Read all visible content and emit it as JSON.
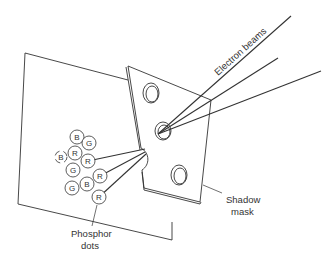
{
  "diagram": {
    "labels": {
      "electron_beams": "Electron beams",
      "shadow_mask_line1": "Shadow",
      "shadow_mask_line2": "mask",
      "phosphor_line1": "Phosphor",
      "phosphor_line2": "dots"
    },
    "phosphor_dots": [
      {
        "label": "B",
        "cx": 77,
        "cy": 137
      },
      {
        "label": "G",
        "cx": 89,
        "cy": 143
      },
      {
        "label": "R",
        "cx": 75,
        "cy": 153
      },
      {
        "label": "B",
        "cx": 61,
        "cy": 157
      },
      {
        "label": "R",
        "cx": 88,
        "cy": 161
      },
      {
        "label": "G",
        "cx": 73,
        "cy": 170
      },
      {
        "label": "R",
        "cx": 100,
        "cy": 176
      },
      {
        "label": "G",
        "cx": 72,
        "cy": 188
      },
      {
        "label": "B",
        "cx": 87,
        "cy": 184
      },
      {
        "label": "R",
        "cx": 99,
        "cy": 197
      }
    ],
    "colors": {
      "stroke": "#333333",
      "background": "#ffffff"
    }
  }
}
